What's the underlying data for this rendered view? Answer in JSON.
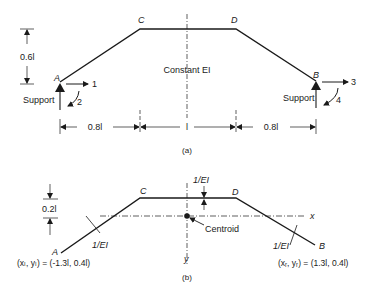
{
  "figure_a": {
    "caption": "(a)",
    "nodes": {
      "A": "A",
      "B": "B",
      "C": "C",
      "D": "D"
    },
    "center_label": "Constant EI",
    "height_dim": "0.6l",
    "span_dims": [
      "0.8l",
      "l",
      "0.8l"
    ],
    "support_left": "Support",
    "support_right": "Support",
    "dof_labels": [
      "1",
      "2",
      "3",
      "4"
    ]
  },
  "figure_b": {
    "caption": "(b)",
    "nodes": {
      "A": "A",
      "B": "B",
      "C": "C",
      "D": "D"
    },
    "offset_dim": "0.2l",
    "top_intensity": "1/EI",
    "left_intensity": "1/EI",
    "right_intensity": "1/EI",
    "centroid_label": "Centroid",
    "axis_x": "x",
    "axis_y": "y",
    "left_coords": "(xₗ, yₗ) = (-1.3l, 0.4l)",
    "right_coords": "(xᵣ, yᵣ) = (1.3l, 0.4l)"
  }
}
